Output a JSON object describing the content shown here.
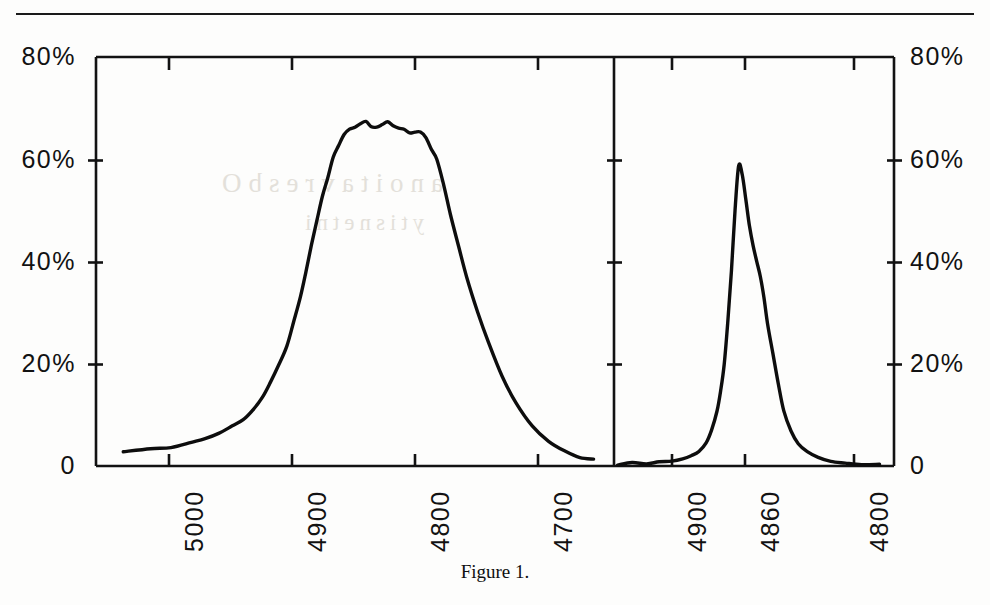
{
  "caption": "Figure 1.",
  "colors": {
    "ink": "#121212",
    "curve": "#0d0d0d",
    "paper": "#fdfdfc"
  },
  "panels": {
    "left": {
      "name": "broad-line-profile",
      "y_ticks": [
        "80%",
        "60%",
        "40%",
        "20%",
        "0"
      ],
      "x_ticks": [
        "5000",
        "4900",
        "4800",
        "4700"
      ]
    },
    "right": {
      "name": "narrow-line-profile",
      "y_ticks": [
        "80%",
        "60%",
        "40%",
        "20%",
        "0"
      ],
      "x_ticks": [
        "4900",
        "4860",
        "4800"
      ]
    }
  },
  "chart_data": {
    "type": "line",
    "title": "Figure 1.",
    "xlabel": "",
    "ylabel": "",
    "grid": false,
    "legend": null,
    "panel_count": 2,
    "shared_y": {
      "label_format": "percent",
      "ticks": [
        0,
        20,
        40,
        60,
        80
      ],
      "tick_labels": [
        "0",
        "20%",
        "40%",
        "60%",
        "80%"
      ],
      "ylim": [
        0,
        80
      ]
    },
    "panels": [
      {
        "name": "left",
        "description": "Broad flat-topped emission line profile",
        "xlabel": "",
        "x_ticks": [
          5000,
          4900,
          4800,
          4700
        ],
        "x_tick_labels": [
          "5000",
          "4900",
          "4800",
          "4700"
        ],
        "xlim": [
          5050,
          4670
        ],
        "x_axis_direction": "decreasing",
        "ylim": [
          0,
          80
        ],
        "peak_value": 67.5,
        "peak_x": 4875,
        "series": [
          {
            "name": "profile",
            "x": [
              5030,
              5010,
              4995,
              4980,
              4970,
              4960,
              4950,
              4942,
              4935,
              4928,
              4922,
              4916,
              4910,
              4905,
              4900,
              4896,
              4892,
              4888,
              4884,
              4880,
              4876,
              4872,
              4868,
              4864,
              4860,
              4856,
              4852,
              4848,
              4844,
              4840,
              4836,
              4832,
              4828,
              4824,
              4820,
              4816,
              4812,
              4808,
              4804,
              4800,
              4795,
              4790,
              4784,
              4778,
              4770,
              4762,
              4752,
              4742,
              4730,
              4718,
              4706,
              4695,
              4685
            ],
            "y": [
              3.0,
              3.2,
              3.8,
              4.6,
              5.4,
              6.4,
              7.8,
              9.2,
              11.0,
              13.4,
              16.2,
              19.6,
              23.6,
              28.0,
              33.0,
              38.0,
              43.0,
              48.0,
              52.6,
              56.6,
              60.0,
              62.6,
              64.6,
              66.0,
              66.8,
              67.2,
              67.4,
              67.1,
              66.8,
              66.9,
              66.6,
              66.2,
              66.4,
              66.0,
              65.6,
              65.2,
              64.6,
              63.6,
              62.0,
              59.6,
              55.0,
              49.0,
              43.0,
              37.0,
              30.0,
              24.0,
              17.6,
              12.4,
              8.0,
              5.0,
              3.0,
              1.8,
              1.2
            ]
          }
        ]
      },
      {
        "name": "right",
        "description": "Narrow emission line profile centered near 4860",
        "xlabel": "",
        "x_ticks": [
          4900,
          4860,
          4800
        ],
        "x_tick_labels": [
          "4900",
          "4860",
          "4800"
        ],
        "xlim": [
          4930,
          4775
        ],
        "x_axis_direction": "decreasing",
        "ylim": [
          0,
          80
        ],
        "peak_value": 58.5,
        "peak_x": 4861,
        "series": [
          {
            "name": "profile",
            "x": [
              4928,
              4920,
              4912,
              4905,
              4898,
              4892,
              4887,
              4883,
              4879,
              4876,
              4873,
              4871,
              4869,
              4867,
              4865,
              4863,
              4861,
              4859,
              4857,
              4855,
              4853,
              4851,
              4849,
              4847,
              4845,
              4842,
              4839,
              4836,
              4832,
              4828,
              4823,
              4817,
              4810,
              4802,
              4793,
              4783
            ],
            "y": [
              0.4,
              0.5,
              0.6,
              0.8,
              1.0,
              1.4,
              2.0,
              3.0,
              4.6,
              7.0,
              10.5,
              14.5,
              20.0,
              28.0,
              38.0,
              50.0,
              58.5,
              57.0,
              52.0,
              47.0,
              43.0,
              40.0,
              37.0,
              33.0,
              28.0,
              22.0,
              16.0,
              11.0,
              7.0,
              4.4,
              2.6,
              1.6,
              1.0,
              0.6,
              0.4,
              0.3
            ]
          }
        ]
      }
    ]
  },
  "ghost_text": {
    "line1": "anoitavresbO",
    "line2": "ytisnetni"
  }
}
